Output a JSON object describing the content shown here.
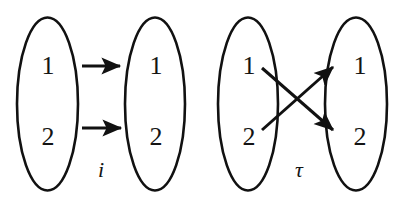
{
  "figure": {
    "background_color": "#ffffff",
    "stroke_color": "#111111",
    "text_color": "#141414",
    "diagrams": [
      {
        "name": "identity-map-diagram",
        "map_label": "i",
        "domain": {
          "name": "domain-set",
          "elements": [
            {
              "label": "1"
            },
            {
              "label": "2"
            }
          ]
        },
        "codomain": {
          "name": "codomain-set",
          "elements": [
            {
              "label": "1"
            },
            {
              "label": "2"
            }
          ]
        },
        "arrows": [
          {
            "from": "1",
            "to": "1",
            "style": "straight"
          },
          {
            "from": "2",
            "to": "2",
            "style": "straight"
          }
        ]
      },
      {
        "name": "transposition-map-diagram",
        "map_label": "τ",
        "domain": {
          "name": "domain-set",
          "elements": [
            {
              "label": "1"
            },
            {
              "label": "2"
            }
          ]
        },
        "codomain": {
          "name": "codomain-set",
          "elements": [
            {
              "label": "1"
            },
            {
              "label": "2"
            }
          ]
        },
        "arrows": [
          {
            "from": "1",
            "to": "2",
            "style": "crossing"
          },
          {
            "from": "2",
            "to": "1",
            "style": "crossing"
          }
        ]
      }
    ]
  }
}
